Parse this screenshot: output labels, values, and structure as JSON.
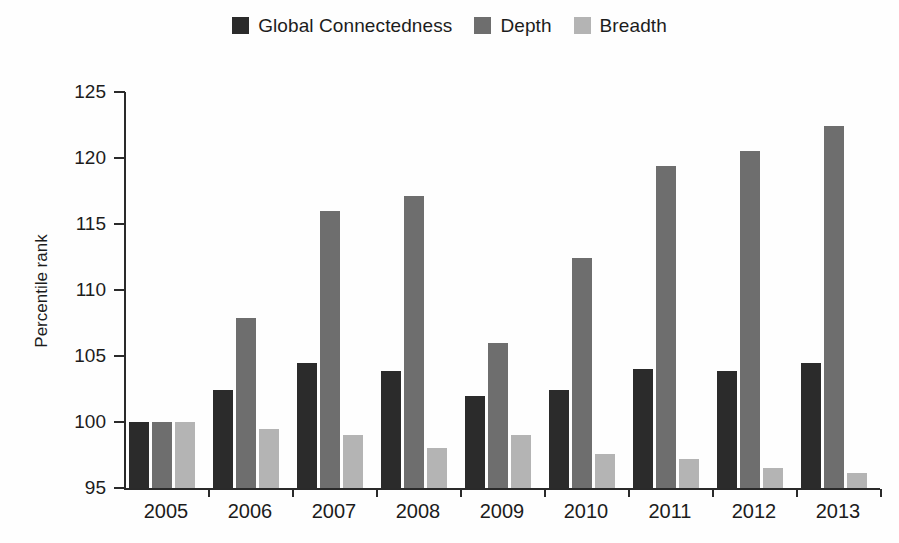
{
  "chart_data": {
    "type": "bar",
    "title": "",
    "subtitle": "",
    "xlabel": "",
    "ylabel": "Percentile rank",
    "categories": [
      "2005",
      "2006",
      "2007",
      "2008",
      "2009",
      "2010",
      "2011",
      "2012",
      "2013"
    ],
    "series": [
      {
        "name": "Global Connectedness",
        "color": "#2b2b2b",
        "values": [
          100.0,
          102.4,
          104.5,
          103.9,
          102.0,
          102.4,
          104.0,
          103.9,
          104.5
        ]
      },
      {
        "name": "Depth",
        "color": "#6e6e6e",
        "values": [
          100.0,
          107.9,
          116.0,
          117.1,
          106.0,
          112.4,
          119.4,
          120.5,
          122.4
        ]
      },
      {
        "name": "Breadth",
        "color": "#b4b4b4",
        "values": [
          100.0,
          99.5,
          99.0,
          98.0,
          99.0,
          97.6,
          97.2,
          96.5,
          96.1
        ]
      }
    ],
    "ylim": [
      95,
      125
    ],
    "ytick_values": [
      95,
      100,
      105,
      110,
      115,
      120,
      125
    ],
    "ytick_labels": [
      "95",
      "100",
      "105",
      "110",
      "115",
      "120",
      "125"
    ],
    "grid": false,
    "legend_position": "top-center"
  },
  "legend": {
    "entries": [
      {
        "label": "Global Connectedness",
        "color": "#2b2b2b"
      },
      {
        "label": "Depth",
        "color": "#6e6e6e"
      },
      {
        "label": "Breadth",
        "color": "#b4b4b4"
      }
    ]
  },
  "axes": {
    "y_title": "Percentile rank",
    "y_labels": [
      "125",
      "120",
      "115",
      "110",
      "105",
      "100",
      "95"
    ],
    "x_labels": [
      "2005",
      "2006",
      "2007",
      "2008",
      "2009",
      "2010",
      "2011",
      "2012",
      "2013"
    ]
  }
}
